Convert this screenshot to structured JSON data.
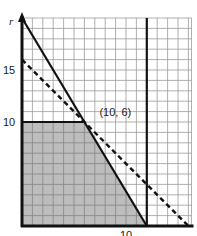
{
  "chart_data": {
    "type": "line",
    "title": "",
    "xlabel": "",
    "ylabel": "r",
    "xlim": [
      0,
      16.3
    ],
    "ylim": [
      0,
      20
    ],
    "grid": true,
    "grid_step": 1,
    "x_tick_labels": [
      {
        "value": 10,
        "label": "10"
      }
    ],
    "y_tick_labels": [
      {
        "value": 10,
        "label": "10"
      },
      {
        "value": 15,
        "label": "15"
      }
    ],
    "series": [
      {
        "name": "solid-constraint",
        "style": "solid",
        "points": [
          [
            0,
            20
          ],
          [
            12,
            0
          ]
        ]
      },
      {
        "name": "dashed-objective",
        "style": "dashed",
        "points": [
          [
            0,
            16
          ],
          [
            16,
            0
          ]
        ]
      },
      {
        "name": "horizontal-constraint",
        "style": "solid",
        "points": [
          [
            0,
            10
          ],
          [
            6,
            10
          ]
        ]
      },
      {
        "name": "vertical-constraint",
        "style": "solid",
        "points": [
          [
            12,
            0
          ],
          [
            12,
            20
          ]
        ]
      }
    ],
    "shaded_region": {
      "vertices": [
        [
          0,
          0
        ],
        [
          0,
          10
        ],
        [
          6,
          10
        ],
        [
          12,
          0
        ]
      ],
      "color": "#bdbdbd"
    },
    "annotations": [
      {
        "text": "(10, 6)",
        "x": 6,
        "y": 10
      }
    ]
  },
  "colors": {
    "shade": "#bdbdbd",
    "grid": "#9a9a9a",
    "line": "#111111"
  }
}
